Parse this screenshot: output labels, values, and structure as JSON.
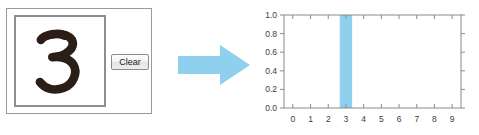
{
  "app": {
    "title": "Handwritten digit recognition demo"
  },
  "draw_panel": {
    "name": "digit-drawing-canvas",
    "drawn_digit": "3",
    "ink_color": "#2b1e17",
    "canvas_background": "#ffffff",
    "panel_border_color": "#9a9a9a",
    "clear_button_label": "Clear"
  },
  "arrow": {
    "icon": "right-arrow-icon",
    "direction": "right",
    "color": "#8ED0EE"
  },
  "chart_data": {
    "type": "bar",
    "title": "",
    "xlabel": "",
    "ylabel": "",
    "categories": [
      "0",
      "1",
      "2",
      "3",
      "4",
      "5",
      "6",
      "7",
      "8",
      "9"
    ],
    "values": [
      0.0,
      0.0,
      0.0,
      1.0,
      0.0,
      0.0,
      0.0,
      0.0,
      0.0,
      0.0
    ],
    "series": [
      {
        "name": "predicted probability",
        "values": [
          0.0,
          0.0,
          0.0,
          1.0,
          0.0,
          0.0,
          0.0,
          0.0,
          0.0,
          0.0
        ]
      }
    ],
    "xlim": [
      -0.5,
      9.5
    ],
    "ylim": [
      0.0,
      1.0
    ],
    "xticks": [
      "0",
      "1",
      "2",
      "3",
      "4",
      "5",
      "6",
      "7",
      "8",
      "9"
    ],
    "yticks": [
      "0.0",
      "0.2",
      "0.4",
      "0.6",
      "0.8",
      "1.0"
    ],
    "bar_color": "#8ED0EE",
    "bar_width": 0.7,
    "grid": false,
    "legend": null,
    "axis_color": "#8a8a8a",
    "tick_label_color": "#3b3b3b"
  }
}
